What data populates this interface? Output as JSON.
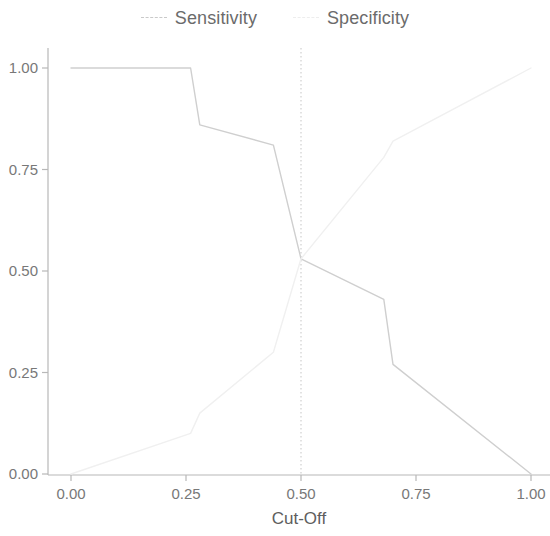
{
  "legend": {
    "items": [
      {
        "label": "Sensitivity",
        "marker": "dashed-line-swatch",
        "color": "#c9c9c9"
      },
      {
        "label": "Specificity",
        "marker": "dashed-line-swatch",
        "color": "#ededed"
      }
    ]
  },
  "chart_data": {
    "type": "line",
    "title": "",
    "xlabel": "Cut-Off",
    "ylabel": "",
    "xlim": [
      0.0,
      1.0
    ],
    "ylim": [
      0.0,
      1.0
    ],
    "grid": false,
    "legend_position": "top-center",
    "x_ticks": [
      "0.00",
      "0.25",
      "0.50",
      "0.75",
      "1.00"
    ],
    "x_tick_values": [
      0.0,
      0.25,
      0.5,
      0.75,
      1.0
    ],
    "y_ticks": [
      "0.00",
      "0.25",
      "0.50",
      "0.75",
      "1.00"
    ],
    "y_tick_values": [
      0.0,
      0.25,
      0.5,
      0.75,
      1.0
    ],
    "annotations": [
      {
        "type": "vertical-reference-line",
        "x": 0.5,
        "style": "dotted",
        "color": "#d6d6d6"
      }
    ],
    "series": [
      {
        "name": "Sensitivity",
        "color": "#cfcfcf",
        "style": "solid",
        "x": [
          0.0,
          0.26,
          0.28,
          0.44,
          0.5,
          0.68,
          0.7,
          1.0
        ],
        "y": [
          1.0,
          1.0,
          0.86,
          0.81,
          0.53,
          0.43,
          0.27,
          0.0
        ]
      },
      {
        "name": "Specificity",
        "color": "#f0f0f0",
        "style": "solid",
        "x": [
          0.0,
          0.26,
          0.28,
          0.44,
          0.5,
          0.68,
          0.7,
          1.0
        ],
        "y": [
          0.0,
          0.1,
          0.15,
          0.3,
          0.53,
          0.78,
          0.82,
          1.0
        ]
      }
    ]
  }
}
